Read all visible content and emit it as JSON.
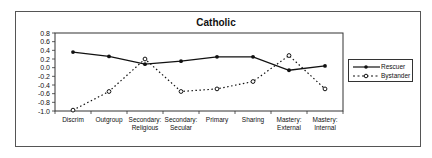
{
  "chart_data": {
    "type": "line",
    "title": "Catholic",
    "xlabel": "",
    "ylabel": "",
    "ylim": [
      -1.0,
      0.8
    ],
    "yticks": [
      "0.8",
      "0.6",
      "0.4",
      "0.2",
      "0.0",
      "-0.2",
      "-0.4",
      "-0.6",
      "-0.8",
      "-1.0"
    ],
    "categories": [
      "Discrim",
      "Outgroup",
      "Secondary: Religious",
      "Secondary: Secular",
      "Primary",
      "Sharing",
      "Mastery: External",
      "Mastery: Internal"
    ],
    "category_lines": [
      [
        "Discrim"
      ],
      [
        "Outgroup"
      ],
      [
        "Secondary:",
        "Religious"
      ],
      [
        "Secondary:",
        "Secular"
      ],
      [
        "Primary"
      ],
      [
        "Sharing"
      ],
      [
        "Mastery:",
        "External"
      ],
      [
        "Mastery:",
        "Internal"
      ]
    ],
    "series": [
      {
        "name": "Rescuer",
        "style": "solid",
        "marker": "filled-circle",
        "values": [
          0.36,
          0.26,
          0.08,
          0.15,
          0.25,
          0.25,
          -0.06,
          0.04
        ]
      },
      {
        "name": "Bystander",
        "style": "dotted",
        "marker": "open-circle",
        "values": [
          -0.98,
          -0.55,
          0.2,
          -0.55,
          -0.49,
          -0.32,
          0.28,
          -0.49
        ]
      }
    ],
    "grid": false,
    "legend_position": "right"
  },
  "legend": {
    "rescuer": "Rescuer",
    "bystander": "Bystander"
  }
}
